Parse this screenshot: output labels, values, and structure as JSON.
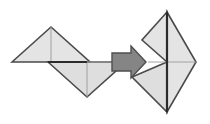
{
  "canvas": {
    "width": 210,
    "height": 124,
    "background": "#ffffff",
    "title": "tangram-transformation-diagram"
  },
  "palette": {
    "shape_fill": "#e4e4e4",
    "shape_fill_alt": "#dedede",
    "shape_stroke": "#4a4a4a",
    "seam_stroke": "#9a9a9a",
    "emphasis_stroke": "#2b2b2b",
    "arrow_fill": "#858585",
    "arrow_stroke": "#4f4f4f"
  },
  "left_group": {
    "name": "left-tangram-cluster",
    "shapes": [
      {
        "name": "upper-left-triangle",
        "points": "12,62 51,27 90,62",
        "fill": "#e4e4e4",
        "stroke": "#4a4a4a"
      },
      {
        "name": "lower-left-triangle",
        "points": "48,62 87,97 126,62",
        "fill": "#dedede",
        "stroke": "#4a4a4a"
      }
    ],
    "seams": [
      {
        "name": "upper-left-median-seam",
        "points": "51,27 51,62",
        "stroke": "#9a9a9a"
      },
      {
        "name": "lower-left-median-seam",
        "points": "87,62 87,97",
        "stroke": "#9a9a9a"
      }
    ],
    "emphasis_edges": [
      {
        "name": "left-base-emphasis-edge",
        "points": "48,62 87,62",
        "stroke": "#2b2b2b"
      }
    ],
    "connector": {
      "name": "left-to-arrow-connector",
      "points": "87,62 112,62",
      "stroke": "#9a9a9a"
    }
  },
  "arrow": {
    "name": "transformation-arrow",
    "direction": "right",
    "points": "112,53 131,53 131,46 146,62 131,78 131,71 112,71",
    "fill": "#858585",
    "stroke": "#4f4f4f"
  },
  "right_group": {
    "name": "right-tangram-cluster",
    "shapes": [
      {
        "name": "right-large-triangle",
        "points": "167,12 196,62 167,112",
        "fill": "#e4e4e4",
        "stroke": "#4a4a4a"
      },
      {
        "name": "right-lower-left-triangle",
        "points": "167,62 167,112 132,77",
        "fill": "#dedede",
        "stroke": "#4a4a4a"
      },
      {
        "name": "right-upper-notch-triangle",
        "points": "167,62 167,12 142,40",
        "fill": "#e4e4e4",
        "stroke": "#4a4a4a"
      }
    ],
    "seams": [
      {
        "name": "right-horizontal-seam",
        "points": "150,62 196,62",
        "stroke": "#9a9a9a"
      },
      {
        "name": "right-lower-diagonal-seam",
        "points": "167,62 146,62",
        "stroke": "#9a9a9a"
      }
    ],
    "emphasis_edges": [
      {
        "name": "right-vertical-emphasis-edge",
        "points": "167,12 167,112",
        "stroke": "#2b2b2b"
      }
    ]
  },
  "labels": {
    "figure_caption": "",
    "left_caption": "",
    "right_caption": ""
  }
}
